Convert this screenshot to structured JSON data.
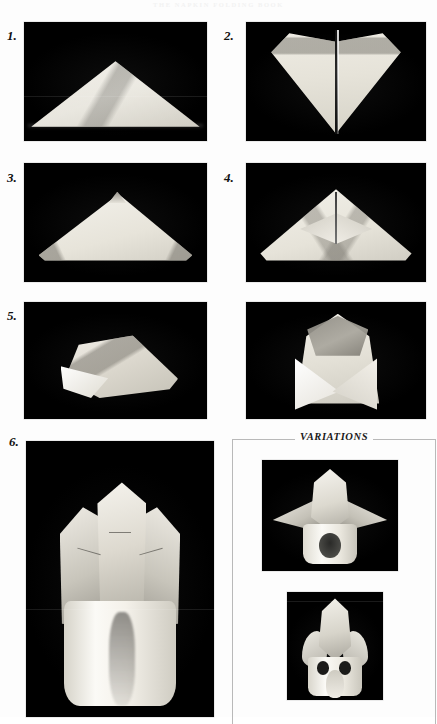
{
  "page": {
    "running_head": "THE NAPKIN FOLDING BOOK",
    "background_color": "#fdfdfd"
  },
  "steps": [
    {
      "number": "1.",
      "caption_alt": "Napkin folded in half into a wide low triangle with striped border bands",
      "photo_background": "#000000"
    },
    {
      "number": "2.",
      "caption_alt": "Napkin opened into a diamond kite shape with a sharp vertical centre fold",
      "photo_background": "#000000"
    },
    {
      "number": "3.",
      "caption_alt": "Triangle with the two upper corners folded down to small flaps at the apex",
      "photo_background": "#000000"
    },
    {
      "number": "4.",
      "caption_alt": "Triangle showing two inner diamond panels formed at the centre",
      "photo_background": "#000000"
    },
    {
      "number": "5.",
      "caption_alt": "The folded napkin turned on its side and rolled at an angle",
      "photo_background": "#000000"
    },
    {
      "number": "",
      "caption_alt": "The roll stood upright forming an envelope with crossed front flaps",
      "photo_background": "#000000"
    },
    {
      "number": "6.",
      "caption_alt": "Finished fold: three upright points rising from a cylindrical base",
      "photo_background": "#000000"
    }
  ],
  "variations": {
    "label": "VARIATIONS",
    "items": [
      {
        "caption_alt": "Variation with a tall central point and two wings spread outward over an open cuff",
        "photo_background": "#000000"
      },
      {
        "caption_alt": "Variation with a narrow bud centre and two rounded side petals above a banded base",
        "photo_background": "#000000"
      }
    ]
  },
  "colors": {
    "page": "#fdfdfd",
    "plate": "#000000",
    "rule": "#b9b9b9",
    "ink": "#111111",
    "linen_light": "#f4f2ec",
    "linen_mid": "#e0ddd3",
    "linen_shadow": "#96938b"
  }
}
